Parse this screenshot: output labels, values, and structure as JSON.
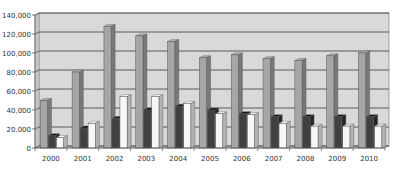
{
  "chart_data": {
    "type": "bar",
    "style": "3d-clustered-column",
    "title": "",
    "xlabel": "",
    "ylabel": "",
    "categories": [
      "2000",
      "2001",
      "2002",
      "2003",
      "2004",
      "2005",
      "2006",
      "2007",
      "2008",
      "2009",
      "2010"
    ],
    "series": [
      {
        "name": "Series 1",
        "color": "#a6a6a6",
        "values": [
          50000,
          80000,
          128000,
          118000,
          112000,
          95000,
          98000,
          94000,
          92000,
          97000,
          100000
        ]
      },
      {
        "name": "Series 2",
        "color": "#404040",
        "values": [
          13000,
          21000,
          31000,
          40000,
          44000,
          40000,
          36000,
          33000,
          33000,
          33000,
          33000
        ]
      },
      {
        "name": "Series 3",
        "color": "#f7f7f7",
        "values": [
          11000,
          26000,
          54000,
          54000,
          47000,
          36000,
          35000,
          26000,
          23000,
          23000,
          23000
        ]
      }
    ],
    "ylim": [
      0,
      140000
    ],
    "yticks": [
      0,
      20000,
      40000,
      60000,
      80000,
      100000,
      120000,
      140000
    ],
    "ytick_labels": [
      "0",
      "20,000",
      "40,000",
      "60,000",
      "80,000",
      "100,000",
      "120,000",
      "140,000"
    ],
    "grid": true,
    "legend": null,
    "plot_background": "#d9d9d9"
  }
}
